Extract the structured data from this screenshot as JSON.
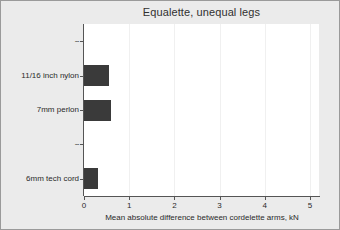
{
  "chart_data": {
    "type": "bar",
    "orientation": "horizontal",
    "title": "Equalette, unequal legs",
    "xlabel": "Mean absolute difference between cordelette arms, kN",
    "ylabel": "",
    "categories": [
      "--",
      "11/16 inch nylon",
      "7mm perlon",
      "--",
      "6mm tech cord"
    ],
    "values": [
      0,
      0.55,
      0.6,
      0,
      0.3
    ],
    "xlim": [
      0,
      5.2
    ],
    "xticks": [
      0,
      1,
      2,
      3,
      4,
      5
    ],
    "xtick_labels": [
      "0",
      "1",
      "2",
      "3",
      "4",
      "5"
    ],
    "grid": true,
    "grid_axis": "x",
    "legend": false,
    "bar_color": "#3a3a3a",
    "plot_background": "#ffffff",
    "figure_background": "#ebebeb",
    "axis_color": "#555555"
  },
  "axis_labels": {
    "x_title": "Mean absolute difference between cordelette arms, kN"
  }
}
